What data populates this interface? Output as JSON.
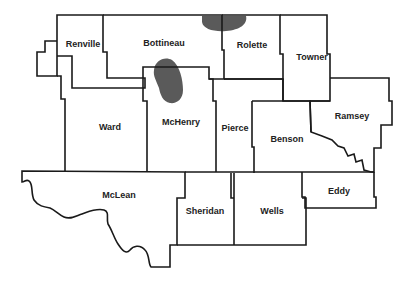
{
  "map": {
    "type": "county outline map",
    "counties": [
      {
        "id": "renville",
        "name": "Renville",
        "x": 83,
        "y": 47
      },
      {
        "id": "bottineau",
        "name": "Bottineau",
        "x": 164,
        "y": 46
      },
      {
        "id": "rolette",
        "name": "Rolette",
        "x": 252,
        "y": 48
      },
      {
        "id": "towner",
        "name": "Towner",
        "x": 312,
        "y": 60
      },
      {
        "id": "ward",
        "name": "Ward",
        "x": 110,
        "y": 129
      },
      {
        "id": "mchenry",
        "name": "McHenry",
        "x": 181,
        "y": 125
      },
      {
        "id": "pierce",
        "name": "Pierce",
        "x": 235,
        "y": 130
      },
      {
        "id": "benson",
        "name": "Benson",
        "x": 287,
        "y": 141
      },
      {
        "id": "ramsey",
        "name": "Ramsey",
        "x": 354,
        "y": 118
      },
      {
        "id": "mclean",
        "name": "McLean",
        "x": 119,
        "y": 197
      },
      {
        "id": "sheridan",
        "name": "Sheridan",
        "x": 205,
        "y": 213
      },
      {
        "id": "wells",
        "name": "Wells",
        "x": 272,
        "y": 213
      },
      {
        "id": "eddy",
        "name": "Eddy",
        "x": 339,
        "y": 193
      }
    ],
    "shaded_areas": [
      {
        "id": "area-north-bottineau-rolette",
        "color": "#5a5a5a"
      },
      {
        "id": "area-bottineau-mchenry",
        "color": "#5a5a5a"
      }
    ],
    "colors": {
      "background": "#ffffff",
      "border": "#1a1a1a",
      "shade": "#5a5a5a",
      "label": "#222222"
    }
  }
}
